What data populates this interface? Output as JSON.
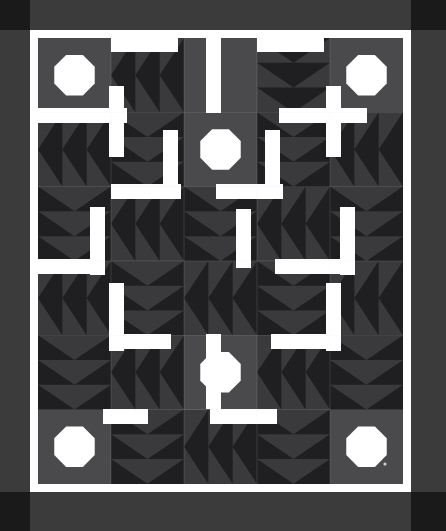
{
  "artwork": {
    "kind": "quilt-pattern-image",
    "title": "Pinwheel Star Sashed Quilt",
    "width": 446,
    "height": 531
  },
  "palette": {
    "background": "#ffffff",
    "border": "#3b3b3b",
    "corner_square": "#1a1a1a",
    "sashing": "#ffffff",
    "block_dark": "#1f1f22",
    "block_mid": "#3a3a3d",
    "block_gray": "#4a4a4d",
    "appliqué_light": "#ffffff",
    "hairline": "#d8d8d8",
    "artifact_dot": "#cfcfcf"
  },
  "geometry": {
    "outer_border": {
      "x": 0,
      "y": 0,
      "w": 446,
      "h": 531,
      "thickness": 30
    },
    "corner_squares": [
      {
        "name": "corner-top-left",
        "x": 0,
        "y": 0,
        "w": 30,
        "h": 30
      },
      {
        "name": "corner-top-right",
        "x": 411,
        "y": 0,
        "w": 35,
        "h": 30
      },
      {
        "name": "corner-bottom-left",
        "x": 0,
        "y": 492,
        "w": 30,
        "h": 39
      },
      {
        "name": "corner-bottom-right",
        "x": 411,
        "y": 492,
        "w": 35,
        "h": 39
      }
    ],
    "inner_white_frame": {
      "x": 30,
      "y": 30,
      "w": 381,
      "h": 462,
      "inset": 8
    },
    "quilt_field": {
      "x": 38,
      "y": 38,
      "w": 365,
      "h": 446
    },
    "grid": {
      "cols": 5,
      "rows": 6,
      "cell_w": 73,
      "cell_h": 74.3,
      "origin_x": 38,
      "origin_y": 38
    }
  },
  "legend": [
    {
      "swatch": "#1f1f22",
      "label": "Dark navy-black print"
    },
    {
      "swatch": "#3a3a3d",
      "label": "Medium charcoal print"
    },
    {
      "swatch": "#4a4a4d",
      "label": "Light charcoal background"
    },
    {
      "swatch": "#ffffff",
      "label": "White sashing and appliqué"
    }
  ],
  "chart_data": {
    "type": "heatmap",
    "categories": [
      "c1",
      "c2",
      "c3",
      "c4",
      "c5"
    ],
    "rows": [
      "r1",
      "r2",
      "r3",
      "r4",
      "r5",
      "r6"
    ],
    "cells": [
      [
        "octagon",
        "geese-left",
        "sash-v",
        "geese-down",
        "octagon"
      ],
      [
        "geese-left",
        "geese-down",
        "octagon-center",
        "geese-down",
        "geese-left"
      ],
      [
        "geese-down",
        "geese-left",
        "geese-down",
        "geese-left",
        "geese-down"
      ],
      [
        "geese-left",
        "geese-down",
        "geese-left",
        "geese-down",
        "geese-left"
      ],
      [
        "geese-down",
        "geese-left",
        "octagon-center",
        "geese-left",
        "geese-down"
      ],
      [
        "octagon",
        "geese-down",
        "geese-left",
        "geese-down",
        "octagon"
      ]
    ],
    "xlabel": "",
    "ylabel": ""
  }
}
